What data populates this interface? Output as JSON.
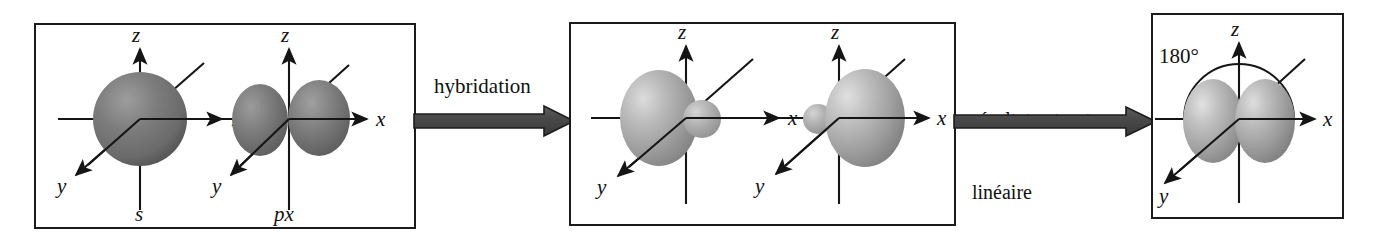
{
  "figure": {
    "background_color": "#ffffff",
    "ink_color": "#151515",
    "orbital_fill_dark": "#6e6e6e",
    "orbital_fill_light": "#b4b4b4",
    "arrow_color": "#4a4a4a"
  },
  "panels": [
    {
      "id": "panel-atomic-orbitals",
      "orbitals": [
        {
          "name": "s-orbital",
          "label": "s",
          "shape": "sphere",
          "axes": {
            "x": "x",
            "y": "y",
            "z": "z"
          }
        },
        {
          "name": "p-orbital",
          "label": "px",
          "shape": "two-lobes",
          "axes": {
            "x": "x",
            "y": "y",
            "z": "z"
          }
        }
      ]
    },
    {
      "id": "panel-hybrid-orbitals",
      "orbitals": [
        {
          "name": "sp-hybrid-left",
          "label": "",
          "shape": "hybrid-large-left",
          "axes": {
            "x": "x",
            "y": "y",
            "z": "z"
          }
        },
        {
          "name": "sp-hybrid-right",
          "label": "",
          "shape": "hybrid-large-right",
          "axes": {
            "x": "x",
            "y": "y",
            "z": "z"
          }
        }
      ]
    },
    {
      "id": "panel-linear-structure",
      "orbitals": [
        {
          "name": "sp-hybrid-pair",
          "label": "",
          "shape": "two-hybrids-opposed",
          "angle_label": "180°",
          "axes": {
            "x": "x",
            "y": "y",
            "z": "z"
          }
        }
      ]
    }
  ],
  "arrows": [
    {
      "id": "arrow-hybridation",
      "label": "hybridation"
    },
    {
      "id": "arrow-resultat",
      "label_line1": "résultat : structure",
      "label_line2": "linéaire"
    }
  ],
  "labels": {
    "s": "s",
    "px": "px",
    "x": "x",
    "y": "y",
    "z": "z",
    "angle": "180°",
    "hybridation": "hybridation",
    "resultat_line1": "résultat : structure",
    "resultat_line2": "linéaire"
  }
}
